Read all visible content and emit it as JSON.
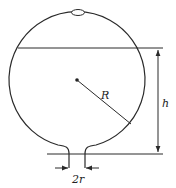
{
  "diagram": {
    "labels": {
      "radius": "R",
      "height": "h",
      "outlet_diameter": "2r"
    },
    "colors": {
      "stroke": "#2a2a2a",
      "background": "#ffffff"
    },
    "geometry": {
      "sphere_center": [
        77,
        80
      ],
      "sphere_radius": 68,
      "water_level_y": 48,
      "base_line_y": 154,
      "outlet_tube_x": [
        69,
        85
      ]
    }
  }
}
